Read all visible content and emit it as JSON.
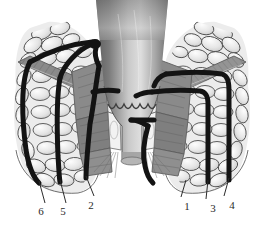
{
  "figure": {
    "background_color": "#ffffff",
    "width": 264,
    "height": 230
  },
  "palette": {
    "tract_black": "#131313",
    "fat_fill": "#e9e9e9",
    "fat_outline": "#4a4a4a",
    "muscle_mid": "#8d8d8d",
    "muscle_dark": "#6f6f6f",
    "muscle_light": "#a9a9a9",
    "lumen_dark": "#6b6b6b",
    "lumen_light": "#d8d8d8",
    "mucosa_white": "#f4f4f4",
    "leader_line": "#2b2b2b",
    "label_text": "#2b2b2b"
  },
  "structures": [
    {
      "name": "rectal-lumen",
      "description": "central funnel shaped rectal lumen with vertical gray gradient"
    },
    {
      "name": "dentate-line",
      "description": "scalloped anal valve line at mid anal canal"
    },
    {
      "name": "internal-sphincter",
      "description": "pale band adjacent to anal canal"
    },
    {
      "name": "external-sphincter",
      "description": "banded gray muscle blocks lateral to anal canal"
    },
    {
      "name": "levator-ani",
      "description": "oblique gray muscle sheet running superolaterally"
    },
    {
      "name": "ischiorectal-fossa-fat-left",
      "description": "lobular fat packets, left side"
    },
    {
      "name": "ischiorectal-fossa-fat-right",
      "description": "lobular fat packets, right side"
    },
    {
      "name": "perianal-skin",
      "description": "outer curved skin margin below anal verge"
    }
  ],
  "tracts": [
    {
      "id": "1",
      "name": "intersphincteric-fistula",
      "side": "right"
    },
    {
      "id": "2",
      "name": "transsphincteric-fistula",
      "side": "left"
    },
    {
      "id": "3",
      "name": "suprasphincteric-fistula",
      "side": "right"
    },
    {
      "id": "4",
      "name": "extrasphincteric-fistula",
      "side": "right"
    },
    {
      "id": "5",
      "name": "high-blind-tract-fistula",
      "side": "left"
    },
    {
      "id": "6",
      "name": "superficial-fistula",
      "side": "left"
    }
  ],
  "labels": [
    {
      "id": "6",
      "text": "6",
      "x": 34,
      "y": 206,
      "leader": {
        "x1": 45,
        "y1": 203,
        "x2": 39,
        "y2": 181
      }
    },
    {
      "id": "5",
      "text": "5",
      "x": 56,
      "y": 206,
      "leader": {
        "x1": 66,
        "y1": 203,
        "x2": 60,
        "y2": 180
      }
    },
    {
      "id": "2",
      "text": "2",
      "x": 84,
      "y": 200,
      "leader": {
        "x1": 94,
        "y1": 196,
        "x2": 86,
        "y2": 176
      }
    },
    {
      "id": "1",
      "text": "1",
      "x": 180,
      "y": 201,
      "leader": {
        "x1": 181,
        "y1": 197,
        "x2": 186,
        "y2": 180
      }
    },
    {
      "id": "3",
      "text": "3",
      "x": 206,
      "y": 203,
      "leader": {
        "x1": 206,
        "y1": 199,
        "x2": 208,
        "y2": 180
      }
    },
    {
      "id": "4",
      "text": "4",
      "x": 225,
      "y": 200,
      "leader": {
        "x1": 224,
        "y1": 196,
        "x2": 229,
        "y2": 178
      }
    }
  ]
}
